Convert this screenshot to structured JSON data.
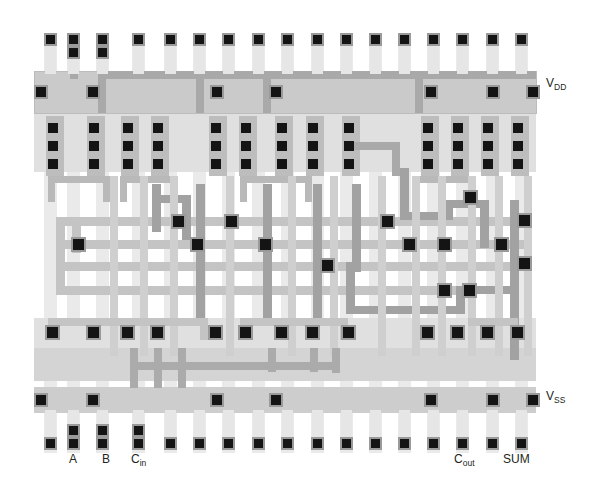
{
  "figure": {
    "kind": "vlsi-mask-layout",
    "width": 598,
    "height": 496,
    "background": "#ffffff"
  },
  "palette": {
    "contact": "#111111",
    "contact_surround": "#8c8c8c",
    "metal1": "#c9c9c9",
    "metal1_light": "#dcdcdc",
    "metal2": "#a8a8a8",
    "poly": "#b5b5b5",
    "diffusion": "#d7d7d7",
    "nwell": "#e4e4e4",
    "vertical_track": "#e8e8e8",
    "label_color": "#231f20"
  },
  "labels": [
    {
      "id": "vdd",
      "text": "V",
      "sub": "DD",
      "x": 546,
      "y": 83,
      "name": "label-vdd"
    },
    {
      "id": "vss",
      "text": "V",
      "sub": "SS",
      "x": 546,
      "y": 396,
      "name": "label-vss"
    },
    {
      "id": "a",
      "text": "A",
      "sub": "",
      "x": 71,
      "y": 458,
      "name": "label-a"
    },
    {
      "id": "b",
      "text": "B",
      "sub": "",
      "x": 104,
      "y": 458,
      "name": "label-b"
    },
    {
      "id": "cin",
      "text": "C",
      "sub": "in",
      "x": 133,
      "y": 458,
      "name": "label-cin"
    },
    {
      "id": "cout",
      "text": "C",
      "sub": "out",
      "x": 456,
      "y": 458,
      "name": "label-cout"
    },
    {
      "id": "sum",
      "text": "SUM",
      "sub": "",
      "x": 506,
      "y": 458,
      "name": "label-sum"
    }
  ],
  "geometry": {
    "vertical_tracks_x": [
      50,
      73,
      102,
      138,
      170,
      199,
      228,
      258,
      287,
      317,
      346,
      375,
      404,
      433,
      462,
      492,
      521
    ],
    "pmos_stack_x": [
      52,
      93,
      127,
      157,
      215,
      245,
      281,
      312,
      348,
      427,
      457,
      487,
      517
    ],
    "nmos_contact_x": [
      52,
      93,
      127,
      157,
      215,
      245,
      281,
      312,
      348,
      427,
      457,
      487,
      517
    ],
    "rail_contact_x": [
      40,
      92,
      216,
      275,
      430,
      492,
      532
    ],
    "vdd_rail_y": 92,
    "vss_rail_y": 400,
    "pmos_row_y": [
      128,
      146,
      164
    ],
    "nmos_row_y": 332,
    "top_pad_y": 40,
    "bottom_pad_y": 445,
    "routing_rows_y": [
      220,
      244,
      264,
      290
    ]
  },
  "counts": {
    "top_pads": 17,
    "bottom_pads": 17,
    "pmos_stacks": 13,
    "nmos_contacts": 13,
    "routing_contacts": 14
  }
}
